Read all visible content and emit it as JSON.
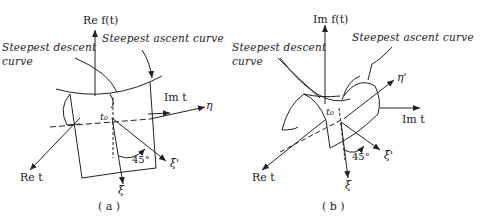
{
  "panels": [
    {
      "id": "a",
      "caption": "( a )",
      "vertical_axis": "Re f(t)",
      "labels": {
        "descent": "Steepest descent",
        "descent_2": "curve",
        "ascent": "Steepest ascent curve",
        "horizontal_axis": "Im t",
        "eta": "η",
        "origin": "t₀",
        "re_t": "Re t",
        "angle": "45°",
        "xi_prime": "ξ'",
        "xi": "ξ"
      }
    },
    {
      "id": "b",
      "caption": "( b )",
      "vertical_axis": "Im f(t)",
      "labels": {
        "descent": "Steepest descent",
        "descent_2": "curve",
        "ascent": "Steepest ascent curve",
        "horizontal_axis": "Im t",
        "eta_prime": "η'",
        "origin": "t₀",
        "re_t": "Re t",
        "angle": "45°",
        "xi_prime": "ξ'",
        "xi": "ξ"
      }
    }
  ],
  "colors": {
    "ink": "#222222",
    "background": "#ffffff"
  }
}
